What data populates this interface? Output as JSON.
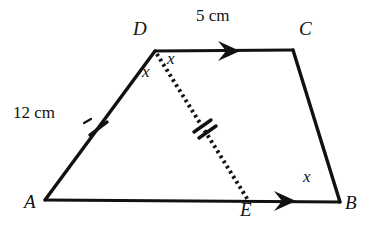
{
  "figure": {
    "background_color": "#ffffff",
    "stroke_color": "#111111",
    "vertices": {
      "A": {
        "label": "A",
        "x": 45,
        "y": 200
      },
      "B": {
        "label": "B",
        "x": 340,
        "y": 202
      },
      "C": {
        "label": "C",
        "x": 293,
        "y": 50
      },
      "D": {
        "label": "D",
        "x": 155,
        "y": 51
      },
      "E": {
        "label": "E",
        "x": 248,
        "y": 200
      }
    },
    "vertex_labels": {
      "A": {
        "text": "A",
        "x": 24,
        "y": 204
      },
      "B": {
        "text": "B",
        "x": 345,
        "y": 205
      },
      "C": {
        "text": "C",
        "x": 299,
        "y": 28
      },
      "D": {
        "text": "D",
        "x": 133,
        "y": 28
      },
      "E": {
        "text": "E",
        "x": 241,
        "y": 206
      }
    },
    "measurements": [
      {
        "name": "side-dc-length",
        "text": "5 cm",
        "x": 197,
        "y": 16
      },
      {
        "name": "side-ad-length",
        "text": "12 cm",
        "x": 14,
        "y": 112
      }
    ],
    "variable_labels": [
      {
        "name": "angle-x-at-d-left",
        "text": "x",
        "x": 143,
        "y": 71
      },
      {
        "name": "angle-x-at-d-right",
        "text": "x",
        "x": 168,
        "y": 58
      },
      {
        "name": "angle-x-at-b",
        "text": "x",
        "x": 303,
        "y": 176
      }
    ],
    "segments": [
      {
        "name": "segment-ad",
        "from": "A",
        "to": "D",
        "style": "solid"
      },
      {
        "name": "segment-dc",
        "from": "D",
        "to": "C",
        "style": "solid"
      },
      {
        "name": "segment-cb",
        "from": "C",
        "to": "B",
        "style": "solid"
      },
      {
        "name": "segment-ab",
        "from": "A",
        "to": "B",
        "style": "solid"
      },
      {
        "name": "segment-de",
        "from": "D",
        "to": "E",
        "style": "dotted"
      }
    ],
    "tick_marks": [
      {
        "name": "single-tick-on-ad",
        "count": 1,
        "x": 98,
        "y": 128
      },
      {
        "name": "double-tick-on-de",
        "count": 2,
        "x": 202,
        "y": 127
      }
    ],
    "arrow_marks": [
      {
        "name": "parallel-arrow-on-dc",
        "x": 232,
        "y": 51,
        "direction": "right"
      },
      {
        "name": "parallel-arrow-on-eb",
        "x": 288,
        "y": 201,
        "direction": "right"
      }
    ]
  }
}
